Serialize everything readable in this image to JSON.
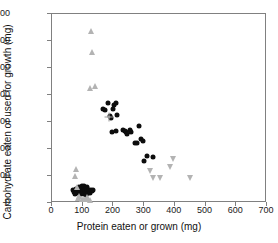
{
  "chart_data": {
    "type": "scatter",
    "title": "",
    "xlabel": "Protein eaten or grown (mg)",
    "ylabel": "Carbohydrate eaten or used for growth (mg)",
    "xlim": [
      0,
      700
    ],
    "ylim": [
      0,
      700
    ],
    "xticks": [
      0,
      100,
      200,
      300,
      400,
      500,
      600,
      700
    ],
    "yticks": [
      0,
      100,
      200,
      300,
      400,
      500,
      600,
      700
    ],
    "grid": false,
    "legend": "none",
    "series": [
      {
        "name": "filled-circle-series",
        "marker": "circle",
        "color": "#0d0d0d",
        "points": [
          [
            70,
            45
          ],
          [
            75,
            38
          ],
          [
            78,
            30
          ],
          [
            82,
            50
          ],
          [
            85,
            42
          ],
          [
            88,
            33
          ],
          [
            90,
            55
          ],
          [
            92,
            46
          ],
          [
            95,
            38
          ],
          [
            97,
            28
          ],
          [
            100,
            60
          ],
          [
            101,
            52
          ],
          [
            103,
            44
          ],
          [
            105,
            36
          ],
          [
            106,
            30
          ],
          [
            108,
            58
          ],
          [
            110,
            50
          ],
          [
            112,
            43
          ],
          [
            113,
            35
          ],
          [
            115,
            27
          ],
          [
            117,
            55
          ],
          [
            118,
            48
          ],
          [
            120,
            40
          ],
          [
            122,
            33
          ],
          [
            124,
            46
          ],
          [
            126,
            40
          ],
          [
            128,
            35
          ],
          [
            130,
            44
          ],
          [
            133,
            41
          ],
          [
            136,
            43
          ],
          [
            170,
            345
          ],
          [
            176,
            342
          ],
          [
            186,
            365
          ],
          [
            191,
            318
          ],
          [
            196,
            312
          ],
          [
            201,
            345
          ],
          [
            206,
            360
          ],
          [
            211,
            365
          ],
          [
            199,
            260
          ],
          [
            212,
            262
          ],
          [
            214,
            323
          ],
          [
            236,
            268
          ],
          [
            241,
            262
          ],
          [
            245,
            258
          ],
          [
            249,
            252
          ],
          [
            256,
            265
          ],
          [
            262,
            258
          ],
          [
            272,
            220
          ],
          [
            281,
            218
          ],
          [
            286,
            283
          ],
          [
            292,
            235
          ],
          [
            298,
            225
          ],
          [
            304,
            151
          ],
          [
            314,
            171
          ],
          [
            331,
            166
          ]
        ]
      },
      {
        "name": "gray-triangle-up-series",
        "marker": "triangle-up",
        "color": "#b3b3b3",
        "points": [
          [
            79,
            97
          ],
          [
            83,
            123
          ],
          [
            85,
            55
          ],
          [
            88,
            14
          ],
          [
            92,
            22
          ],
          [
            100,
            10
          ],
          [
            108,
            12
          ],
          [
            116,
            18
          ],
          [
            122,
            12
          ],
          [
            127,
            8
          ],
          [
            126,
            422
          ],
          [
            131,
            633
          ],
          [
            132,
            557
          ],
          [
            144,
            430
          ]
        ]
      },
      {
        "name": "gray-triangle-down-series",
        "marker": "triangle-down",
        "color": "#b3b3b3",
        "points": [
          [
            322,
            116
          ],
          [
            333,
            90
          ],
          [
            356,
            90
          ],
          [
            387,
            131
          ],
          [
            396,
            158
          ],
          [
            451,
            90
          ]
        ]
      },
      {
        "name": "gray-mean-cross",
        "marker": "cross-with-open-circle",
        "color": "#9a9a9a",
        "points": [
          [
            190,
            313
          ]
        ]
      }
    ]
  },
  "axes": {
    "x_tick_labels": [
      "0",
      "100",
      "200",
      "300",
      "400",
      "500",
      "600",
      "700"
    ],
    "y_tick_labels": [
      "0",
      "100",
      "200",
      "300",
      "400",
      "500",
      "600",
      "700"
    ]
  },
  "style": {
    "frame_color": "#808080",
    "marker_dark": "#0d0d0d",
    "marker_gray": "#b3b3b3",
    "text_color": "#111111",
    "background": "#ffffff"
  }
}
